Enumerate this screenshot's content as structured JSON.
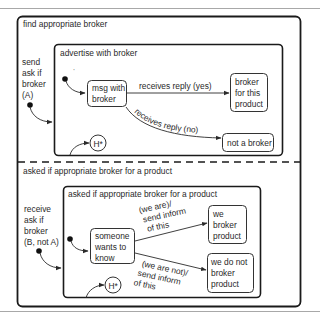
{
  "diagram": {
    "type": "statechart",
    "outer_region_top": {
      "label": "find appropriate broker",
      "trigger_label_lines": [
        "send",
        "ask if",
        "broker",
        "(A)"
      ],
      "inner_state": {
        "label": "advertise with broker",
        "initial_state": {
          "lines": [
            "msg with",
            "broker"
          ]
        },
        "states": [
          {
            "id": "broker-for-this-product",
            "lines": [
              "broker",
              "for this",
              "product"
            ]
          },
          {
            "id": "not-a-broker",
            "lines": [
              "not a broker"
            ]
          }
        ],
        "transitions": [
          {
            "from": "msg with broker",
            "to": "broker for this product",
            "label": "receives reply (yes)"
          },
          {
            "from": "msg with broker",
            "to": "not a broker",
            "label": "receives reply (no)"
          }
        ],
        "history": "H*"
      }
    },
    "outer_region_bottom": {
      "label": "asked if appropriate broker for a product",
      "trigger_label_lines": [
        "receive",
        "ask if",
        "broker",
        "(B, not A)"
      ],
      "inner_state": {
        "label": "asked if appropriate broker for a product",
        "initial_state": {
          "lines": [
            "someone",
            "wants to",
            "know"
          ]
        },
        "states": [
          {
            "id": "we-broker-product",
            "lines": [
              "we",
              "broker",
              "product"
            ]
          },
          {
            "id": "we-do-not-broker-product",
            "lines": [
              "we do not",
              "broker",
              "product"
            ]
          }
        ],
        "transitions": [
          {
            "from": "someone wants to know",
            "to": "we broker product",
            "label_lines": [
              "(we are)/",
              "send inform",
              "of this"
            ]
          },
          {
            "from": "someone wants to know",
            "to": "we do not broker product",
            "label_lines": [
              "(we are not)/",
              "send inform",
              "of this"
            ]
          }
        ],
        "history": "H*"
      }
    },
    "colors": {
      "stroke": "#2a2a2a",
      "background": "#ffffff",
      "rule": "#a8a8a8"
    }
  }
}
